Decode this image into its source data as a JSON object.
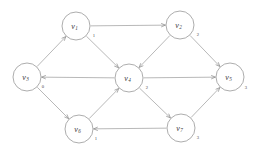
{
  "figure": {
    "background_color": "#ffffff",
    "node_stroke_color": "#8a8a8a",
    "edge_stroke_color": "#9a9a9a",
    "label_color": "#3a3a3a"
  },
  "nodes": [
    {
      "id": "v1",
      "name": "v",
      "subscript": "1",
      "weight": "1",
      "cx": 76,
      "cy": 26,
      "r": 14,
      "weight_x": 94,
      "weight_y": 35
    },
    {
      "id": "v2",
      "name": "v",
      "subscript": "2",
      "weight": "2",
      "cx": 180,
      "cy": 25,
      "r": 14,
      "weight_x": 198,
      "weight_y": 34
    },
    {
      "id": "v3",
      "name": "v",
      "subscript": "3",
      "weight": "0",
      "cx": 27,
      "cy": 77,
      "r": 14,
      "weight_x": 43,
      "weight_y": 86
    },
    {
      "id": "v4",
      "name": "v",
      "subscript": "4",
      "weight": "2",
      "cx": 129,
      "cy": 78,
      "r": 14,
      "weight_x": 147,
      "weight_y": 87
    },
    {
      "id": "v5",
      "name": "v",
      "subscript": "5",
      "weight": "3",
      "cx": 230,
      "cy": 77,
      "r": 14,
      "weight_x": 246,
      "weight_y": 87
    },
    {
      "id": "v6",
      "name": "v",
      "subscript": "6",
      "weight": "1",
      "cx": 79,
      "cy": 129,
      "r": 14,
      "weight_x": 96,
      "weight_y": 138
    },
    {
      "id": "v7",
      "name": "v",
      "subscript": "7",
      "weight": "3",
      "cx": 181,
      "cy": 128,
      "r": 14,
      "weight_x": 198,
      "weight_y": 137
    }
  ],
  "edges": [
    {
      "id": "e-v3-v1",
      "from": "v3",
      "to": "v1",
      "directed": true
    },
    {
      "id": "e-v1-v2",
      "from": "v1",
      "to": "v2",
      "directed": true
    },
    {
      "id": "e-v1-v4",
      "from": "v1",
      "to": "v4",
      "directed": true
    },
    {
      "id": "e-v2-v4",
      "from": "v2",
      "to": "v4",
      "directed": true
    },
    {
      "id": "e-v2-v5",
      "from": "v2",
      "to": "v5",
      "directed": true
    },
    {
      "id": "e-v4-v3",
      "from": "v4",
      "to": "v3",
      "directed": true
    },
    {
      "id": "e-v4-v5",
      "from": "v4",
      "to": "v5",
      "directed": true
    },
    {
      "id": "e-v4-v7",
      "from": "v4",
      "to": "v7",
      "directed": true
    },
    {
      "id": "e-v3-v6",
      "from": "v3",
      "to": "v6",
      "directed": true
    },
    {
      "id": "e-v6-v4",
      "from": "v6",
      "to": "v4",
      "directed": true
    },
    {
      "id": "e-v7-v6",
      "from": "v7",
      "to": "v6",
      "directed": true
    },
    {
      "id": "e-v7-v5",
      "from": "v7",
      "to": "v5",
      "directed": true
    }
  ]
}
